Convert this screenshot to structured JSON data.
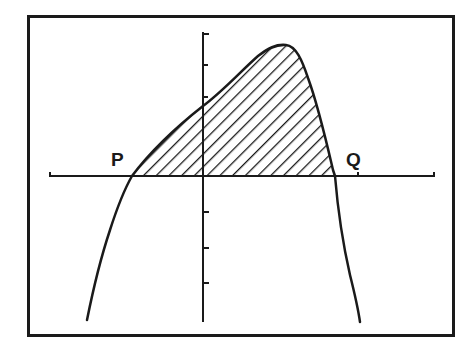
{
  "figure": {
    "type": "function-graph-shaded-area",
    "colors": {
      "background": "#ffffff",
      "ink": "#1a1a1a"
    },
    "frame": {
      "x": 28,
      "y": 16,
      "width": 426,
      "height": 320
    },
    "x_axis": {
      "y": 176,
      "x_start": 50,
      "x_end": 434,
      "tick_marks": [
        358
      ]
    },
    "y_axis": {
      "x": 203,
      "y_start": 32,
      "y_end": 322,
      "tick_marks_above": [
        34,
        65,
        97
      ],
      "tick_marks_below": [
        212,
        248,
        283
      ]
    },
    "points": [
      {
        "id": "P",
        "label": "P",
        "x_intercept_px": 132
      },
      {
        "id": "Q",
        "label": "Q",
        "x_intercept_px": 335
      }
    ],
    "shaded_region": {
      "from": "P",
      "to": "Q",
      "pattern": "diagonal-hatch"
    },
    "curve_description": "Rises from lower-left, crosses x-axis at P, peaks right of the y-axis, falls steeply through Q to lower-right"
  },
  "labels": {
    "p": "P",
    "q": "Q"
  }
}
